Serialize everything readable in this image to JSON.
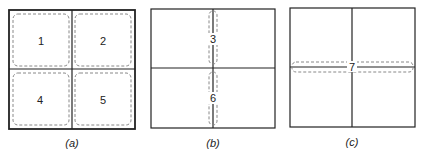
{
  "panels": [
    {
      "id": "a",
      "caption": "(a)",
      "regions": [
        "1",
        "2",
        "4",
        "5"
      ]
    },
    {
      "id": "b",
      "caption": "(b)",
      "regions": [
        "3",
        "6"
      ]
    },
    {
      "id": "c",
      "caption": "(c)",
      "regions": [
        "7"
      ]
    }
  ],
  "colors": {
    "line": "#222222",
    "dashed": "#888888"
  }
}
